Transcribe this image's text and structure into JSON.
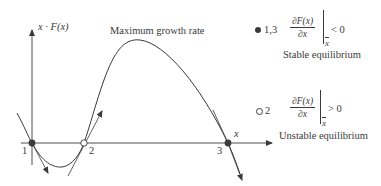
{
  "axes": {
    "y_label": "x · F(x)",
    "x_label": "x"
  },
  "annotation": {
    "peak_label": "Maximum growth rate"
  },
  "points": [
    {
      "id": "1",
      "label": "1",
      "type": "filled"
    },
    {
      "id": "2",
      "label": "2",
      "type": "open"
    },
    {
      "id": "3",
      "label": "3",
      "type": "filled"
    }
  ],
  "legend": {
    "stable": {
      "marker": "filled",
      "points_label": "1,3",
      "numerator": "∂F(x)",
      "denominator": "∂x",
      "eval_at": "x",
      "comparison": "< 0",
      "description": "Stable equilibrium"
    },
    "unstable": {
      "marker": "open",
      "points_label": "2",
      "numerator": "∂F(x)",
      "denominator": "∂x",
      "eval_at": "x",
      "comparison": "> 0",
      "description": "Unstable equilibrium"
    }
  },
  "colors": {
    "line": "#3a3a3a",
    "point_fill": "#3a3a3a",
    "open_fill": "#ffffff"
  }
}
